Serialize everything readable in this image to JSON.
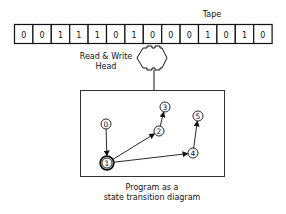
{
  "tape": {
    "label": "Tape",
    "cells": [
      "0",
      "0",
      "1",
      "1",
      "1",
      "0",
      "1",
      "0",
      "0",
      "0",
      "1",
      "0",
      "1",
      "0"
    ]
  },
  "head": {
    "label_line1": "Read & Write",
    "label_line2": "Head"
  },
  "program": {
    "caption_line1": "Program as a",
    "caption_line2": "state transition diagram",
    "states": [
      {
        "id": "0",
        "x": 106,
        "y": 124,
        "accepting": false
      },
      {
        "id": "1",
        "x": 107,
        "y": 163,
        "accepting": true
      },
      {
        "id": "2",
        "x": 159,
        "y": 131,
        "accepting": false
      },
      {
        "id": "3",
        "x": 165,
        "y": 107,
        "accepting": false
      },
      {
        "id": "4",
        "x": 193,
        "y": 153,
        "accepting": false
      },
      {
        "id": "5",
        "x": 198,
        "y": 116,
        "accepting": false
      }
    ],
    "transitions": [
      {
        "from": "0",
        "to": "1"
      },
      {
        "from": "1",
        "to": "2"
      },
      {
        "from": "2",
        "to": "3"
      },
      {
        "from": "1",
        "to": "4"
      },
      {
        "from": "4",
        "to": "5"
      }
    ]
  }
}
